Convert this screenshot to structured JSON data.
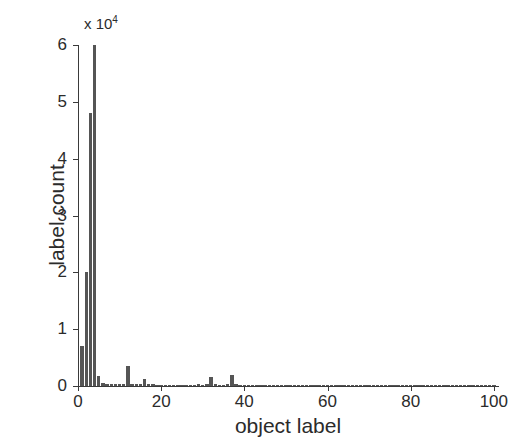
{
  "figure": {
    "background_color": "#ffffff",
    "bar_color": "#555555",
    "axis_color": "#3a3a3a"
  },
  "axes": {
    "y_multiplier_text": "x 10",
    "y_multiplier_exponent": "4",
    "x_title": "object label",
    "y_title": "label count",
    "x_ticks": [
      "0",
      "20",
      "40",
      "60",
      "80",
      "100"
    ],
    "y_ticks": [
      "0",
      "1",
      "2",
      "3",
      "4",
      "5",
      "6"
    ]
  },
  "chart_data": {
    "type": "bar",
    "title": "",
    "xlabel": "object label",
    "ylabel": "label count",
    "y_scale_multiplier": 10000,
    "y_scale_label": "x 10^4",
    "xlim": [
      0,
      101
    ],
    "ylim": [
      0,
      6
    ],
    "grid": false,
    "legend": false,
    "x": [
      1,
      2,
      3,
      4,
      5,
      6,
      7,
      8,
      9,
      10,
      11,
      12,
      13,
      14,
      15,
      16,
      17,
      18,
      19,
      20,
      21,
      22,
      23,
      24,
      25,
      26,
      27,
      28,
      29,
      30,
      31,
      32,
      33,
      34,
      35,
      36,
      37,
      38,
      39,
      40,
      41,
      42,
      43,
      44,
      45,
      46,
      47,
      48,
      49,
      50,
      51,
      52,
      53,
      54,
      55,
      56,
      57,
      58,
      59,
      60,
      61,
      62,
      63,
      64,
      65,
      66,
      67,
      68,
      69,
      70,
      71,
      72,
      73,
      74,
      75,
      76,
      77,
      78,
      79,
      80,
      81,
      82,
      83,
      84,
      85,
      86,
      87,
      88,
      89,
      90,
      91,
      92,
      93,
      94,
      95,
      96,
      97,
      98,
      99,
      100
    ],
    "values": [
      0.7,
      2.0,
      4.8,
      6.0,
      0.18,
      0.05,
      0.04,
      0.04,
      0.03,
      0.03,
      0.03,
      0.35,
      0.04,
      0.03,
      0.03,
      0.12,
      0.03,
      0.03,
      0.02,
      0.02,
      0.02,
      0.02,
      0.02,
      0.02,
      0.02,
      0.02,
      0.02,
      0.02,
      0.03,
      0.02,
      0.03,
      0.16,
      0.03,
      0.02,
      0.02,
      0.03,
      0.2,
      0.03,
      0.02,
      0.02,
      0.02,
      0.02,
      0.02,
      0.02,
      0.02,
      0.02,
      0.02,
      0.02,
      0.02,
      0.02,
      0.02,
      0.02,
      0.02,
      0.02,
      0.02,
      0.02,
      0.02,
      0.02,
      0.02,
      0.02,
      0.02,
      0.02,
      0.02,
      0.02,
      0.02,
      0.02,
      0.02,
      0.02,
      0.02,
      0.02,
      0.02,
      0.02,
      0.02,
      0.02,
      0.02,
      0.02,
      0.02,
      0.02,
      0.02,
      0.02,
      0.02,
      0.02,
      0.02,
      0.02,
      0.02,
      0.02,
      0.02,
      0.02,
      0.02,
      0.02,
      0.02,
      0.02,
      0.02,
      0.02,
      0.02,
      0.02,
      0.02,
      0.02,
      0.02,
      0.02
    ],
    "value_units": "counts in units of 10^4"
  }
}
